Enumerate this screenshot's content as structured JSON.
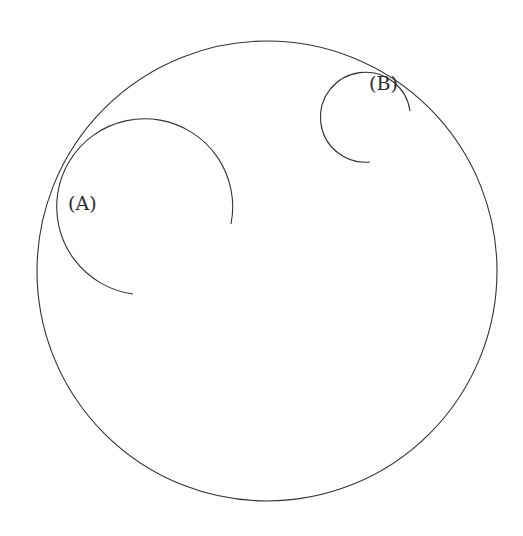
{
  "diagram": {
    "type": "geometry",
    "outer_circle": {
      "cx": 267,
      "cy": 271,
      "r": 230
    },
    "arcs": [
      {
        "id": "A",
        "label": "(A)",
        "cx": 145,
        "cy": 207,
        "r": 88,
        "path": "M 133 294 A 88 88 0 1 1 231 224",
        "label_x": 68,
        "label_y": 210
      },
      {
        "id": "B",
        "label": "(B)",
        "cx": 370,
        "cy": 98,
        "r": 45,
        "path": "M 370 162 A 45 45 0 1 1 410 111",
        "label_x": 369,
        "label_y": 90
      }
    ],
    "colors": {
      "stroke": "#333333",
      "background": "#ffffff"
    }
  }
}
